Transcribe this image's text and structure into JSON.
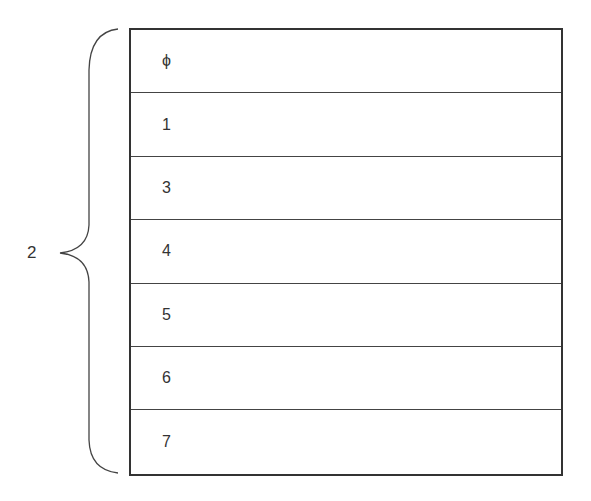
{
  "brace": {
    "label": "2"
  },
  "rows": [
    {
      "label": "ϕ"
    },
    {
      "label": "1"
    },
    {
      "label": "3"
    },
    {
      "label": "4"
    },
    {
      "label": "5"
    },
    {
      "label": "6"
    },
    {
      "label": "7"
    }
  ],
  "colors": {
    "stroke": "#333333",
    "background": "#ffffff"
  }
}
